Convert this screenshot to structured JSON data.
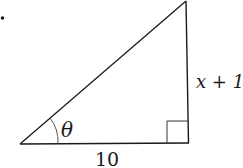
{
  "diagram": {
    "type": "right-triangle",
    "bullet": "•",
    "labels": {
      "angle": "θ",
      "vertical_side": "x + 1",
      "base": "10"
    },
    "colors": {
      "stroke": "#1a1a1a",
      "arc": "#555555",
      "background": "#ffffff"
    },
    "vertices": {
      "left": [
        20,
        144
      ],
      "right_angle": [
        188,
        143
      ],
      "top": [
        186,
        0
      ]
    }
  }
}
